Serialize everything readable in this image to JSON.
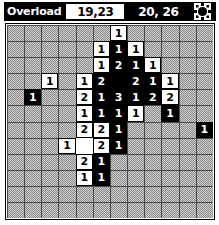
{
  "window": {
    "title": "Overload"
  },
  "titlebar": {
    "cursor_field": {
      "value": "19,23",
      "name": "cursor-coordinates"
    },
    "size_field": {
      "value": "20, 26",
      "name": "board-size"
    },
    "gear": {
      "icon": "gear-icon",
      "label": "Settings"
    },
    "colors": {
      "bar_background": "#000000",
      "bar_text": "#ffffff",
      "field_background": "#ffffff",
      "field_text": "#000000"
    }
  },
  "board": {
    "columns": 12,
    "rows": 12,
    "colors": {
      "hidden_cell": "#a8a8a8",
      "hidden_gridline": "#4a4a4a",
      "revealed_light_bg": "#ffffff",
      "revealed_light_text": "#000000",
      "revealed_dark_bg": "#000000",
      "revealed_dark_text": "#ffffff",
      "frame_border": "#000000"
    },
    "cells": [
      [
        {
          "state": "hidden",
          "value": ""
        },
        {
          "state": "hidden",
          "value": ""
        },
        {
          "state": "hidden",
          "value": ""
        },
        {
          "state": "hidden",
          "value": ""
        },
        {
          "state": "hidden",
          "value": ""
        },
        {
          "state": "hidden",
          "value": ""
        },
        {
          "state": "open-light",
          "value": "1"
        },
        {
          "state": "hidden",
          "value": ""
        },
        {
          "state": "hidden",
          "value": ""
        },
        {
          "state": "hidden",
          "value": ""
        },
        {
          "state": "hidden",
          "value": ""
        },
        {
          "state": "hidden",
          "value": ""
        }
      ],
      [
        {
          "state": "hidden",
          "value": ""
        },
        {
          "state": "hidden",
          "value": ""
        },
        {
          "state": "hidden",
          "value": ""
        },
        {
          "state": "hidden",
          "value": ""
        },
        {
          "state": "hidden",
          "value": ""
        },
        {
          "state": "open-light",
          "value": "1"
        },
        {
          "state": "open-dark",
          "value": "1"
        },
        {
          "state": "open-light",
          "value": "1"
        },
        {
          "state": "hidden",
          "value": ""
        },
        {
          "state": "hidden",
          "value": ""
        },
        {
          "state": "hidden",
          "value": ""
        },
        {
          "state": "hidden",
          "value": ""
        }
      ],
      [
        {
          "state": "hidden",
          "value": ""
        },
        {
          "state": "hidden",
          "value": ""
        },
        {
          "state": "hidden",
          "value": ""
        },
        {
          "state": "hidden",
          "value": ""
        },
        {
          "state": "hidden",
          "value": ""
        },
        {
          "state": "open-light",
          "value": "1"
        },
        {
          "state": "open-dark",
          "value": "2"
        },
        {
          "state": "open-dark",
          "value": "1"
        },
        {
          "state": "open-light",
          "value": "1"
        },
        {
          "state": "hidden",
          "value": ""
        },
        {
          "state": "hidden",
          "value": ""
        },
        {
          "state": "hidden",
          "value": ""
        }
      ],
      [
        {
          "state": "hidden",
          "value": ""
        },
        {
          "state": "hidden",
          "value": ""
        },
        {
          "state": "open-light",
          "value": "1"
        },
        {
          "state": "hidden",
          "value": ""
        },
        {
          "state": "open-light",
          "value": "1"
        },
        {
          "state": "open-dark",
          "value": "2"
        },
        {
          "state": "open-dark",
          "value": ""
        },
        {
          "state": "open-dark",
          "value": "2"
        },
        {
          "state": "open-dark",
          "value": "1"
        },
        {
          "state": "open-light",
          "value": "1"
        },
        {
          "state": "hidden",
          "value": ""
        },
        {
          "state": "hidden",
          "value": ""
        }
      ],
      [
        {
          "state": "hidden",
          "value": ""
        },
        {
          "state": "open-dark",
          "value": "1"
        },
        {
          "state": "hidden",
          "value": ""
        },
        {
          "state": "hidden",
          "value": ""
        },
        {
          "state": "open-light",
          "value": "2"
        },
        {
          "state": "open-dark",
          "value": "1"
        },
        {
          "state": "open-dark",
          "value": "3"
        },
        {
          "state": "open-dark",
          "value": "1"
        },
        {
          "state": "open-dark",
          "value": "2"
        },
        {
          "state": "open-light",
          "value": "2"
        },
        {
          "state": "hidden",
          "value": ""
        },
        {
          "state": "hidden",
          "value": ""
        }
      ],
      [
        {
          "state": "hidden",
          "value": ""
        },
        {
          "state": "hidden",
          "value": ""
        },
        {
          "state": "hidden",
          "value": ""
        },
        {
          "state": "hidden",
          "value": ""
        },
        {
          "state": "open-light",
          "value": "1"
        },
        {
          "state": "open-dark",
          "value": "1"
        },
        {
          "state": "open-dark",
          "value": "1"
        },
        {
          "state": "open-light",
          "value": "1"
        },
        {
          "state": "hidden",
          "value": ""
        },
        {
          "state": "open-dark",
          "value": "1"
        },
        {
          "state": "hidden",
          "value": ""
        },
        {
          "state": "hidden",
          "value": ""
        }
      ],
      [
        {
          "state": "hidden",
          "value": ""
        },
        {
          "state": "hidden",
          "value": ""
        },
        {
          "state": "hidden",
          "value": ""
        },
        {
          "state": "hidden",
          "value": ""
        },
        {
          "state": "open-light",
          "value": "2"
        },
        {
          "state": "open-light",
          "value": "2"
        },
        {
          "state": "open-dark",
          "value": "1"
        },
        {
          "state": "hidden",
          "value": ""
        },
        {
          "state": "hidden",
          "value": ""
        },
        {
          "state": "hidden",
          "value": ""
        },
        {
          "state": "hidden",
          "value": ""
        },
        {
          "state": "open-dark",
          "value": "1"
        }
      ],
      [
        {
          "state": "hidden",
          "value": ""
        },
        {
          "state": "hidden",
          "value": ""
        },
        {
          "state": "hidden",
          "value": ""
        },
        {
          "state": "open-light",
          "value": "1"
        },
        {
          "state": "open-blank",
          "value": ""
        },
        {
          "state": "open-light",
          "value": "2"
        },
        {
          "state": "open-dark",
          "value": "1"
        },
        {
          "state": "hidden",
          "value": ""
        },
        {
          "state": "hidden",
          "value": ""
        },
        {
          "state": "hidden",
          "value": ""
        },
        {
          "state": "hidden",
          "value": ""
        },
        {
          "state": "hidden",
          "value": ""
        }
      ],
      [
        {
          "state": "hidden",
          "value": ""
        },
        {
          "state": "hidden",
          "value": ""
        },
        {
          "state": "hidden",
          "value": ""
        },
        {
          "state": "hidden",
          "value": ""
        },
        {
          "state": "open-light",
          "value": "2"
        },
        {
          "state": "open-dark",
          "value": "1"
        },
        {
          "state": "hidden",
          "value": ""
        },
        {
          "state": "hidden",
          "value": ""
        },
        {
          "state": "hidden",
          "value": ""
        },
        {
          "state": "hidden",
          "value": ""
        },
        {
          "state": "hidden",
          "value": ""
        },
        {
          "state": "hidden",
          "value": ""
        }
      ],
      [
        {
          "state": "hidden",
          "value": ""
        },
        {
          "state": "hidden",
          "value": ""
        },
        {
          "state": "hidden",
          "value": ""
        },
        {
          "state": "hidden",
          "value": ""
        },
        {
          "state": "open-light",
          "value": "1"
        },
        {
          "state": "open-dark",
          "value": "1"
        },
        {
          "state": "hidden",
          "value": ""
        },
        {
          "state": "hidden",
          "value": ""
        },
        {
          "state": "hidden",
          "value": ""
        },
        {
          "state": "hidden",
          "value": ""
        },
        {
          "state": "hidden",
          "value": ""
        },
        {
          "state": "hidden",
          "value": ""
        }
      ],
      [
        {
          "state": "hidden",
          "value": ""
        },
        {
          "state": "hidden",
          "value": ""
        },
        {
          "state": "hidden",
          "value": ""
        },
        {
          "state": "hidden",
          "value": ""
        },
        {
          "state": "hidden",
          "value": ""
        },
        {
          "state": "hidden",
          "value": ""
        },
        {
          "state": "hidden",
          "value": ""
        },
        {
          "state": "hidden",
          "value": ""
        },
        {
          "state": "hidden",
          "value": ""
        },
        {
          "state": "hidden",
          "value": ""
        },
        {
          "state": "hidden",
          "value": ""
        },
        {
          "state": "hidden",
          "value": ""
        }
      ],
      [
        {
          "state": "hidden",
          "value": ""
        },
        {
          "state": "hidden",
          "value": ""
        },
        {
          "state": "hidden",
          "value": ""
        },
        {
          "state": "hidden",
          "value": ""
        },
        {
          "state": "hidden",
          "value": ""
        },
        {
          "state": "hidden",
          "value": ""
        },
        {
          "state": "hidden",
          "value": ""
        },
        {
          "state": "hidden",
          "value": ""
        },
        {
          "state": "hidden",
          "value": ""
        },
        {
          "state": "hidden",
          "value": ""
        },
        {
          "state": "hidden",
          "value": ""
        },
        {
          "state": "hidden",
          "value": ""
        }
      ]
    ]
  }
}
